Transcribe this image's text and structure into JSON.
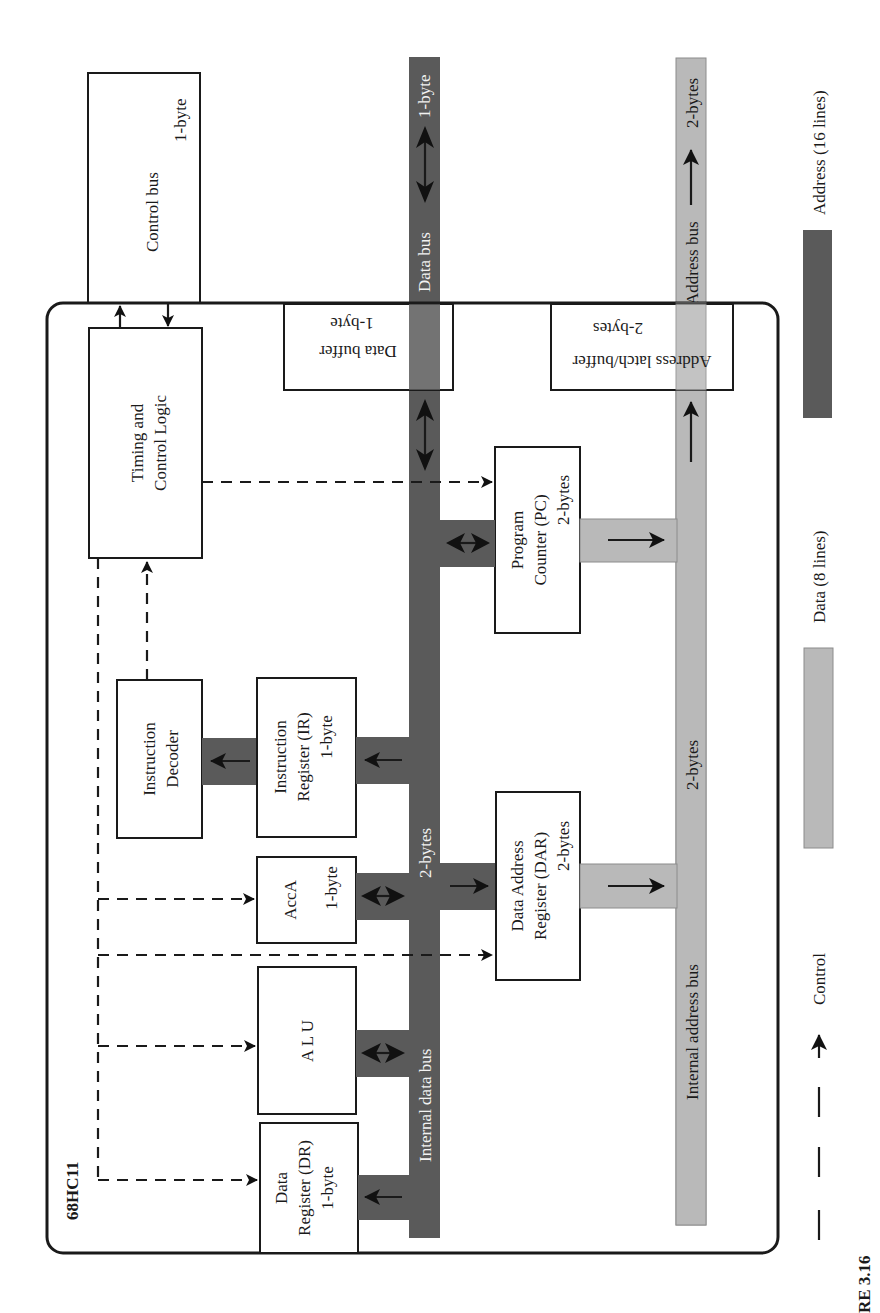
{
  "figure": {
    "chip_label": "68HC11",
    "caption_fragment": "RE 3.16"
  },
  "external": {
    "control_bus": {
      "title": "Control bus",
      "width": "1-byte"
    },
    "data_bus": {
      "title": "Data bus",
      "width": "1-byte"
    },
    "address_bus": {
      "title": "Address bus",
      "width": "2-bytes"
    }
  },
  "blocks": {
    "timing": {
      "line1": "Timing and",
      "line2": "Control Logic"
    },
    "data_buffer": {
      "line1": "Data buffer",
      "line2": "1-byte"
    },
    "address_latch": {
      "line1": "Address latch/buffer",
      "line2": "2-bytes"
    },
    "program_counter": {
      "line1": "Program",
      "line2": "Counter (PC)",
      "line3": "2-bytes"
    },
    "instruction_decoder": {
      "line1": "Instruction",
      "line2": "Decoder"
    },
    "instruction_register": {
      "line1": "Instruction",
      "line2": "Register (IR)",
      "line3": "1-byte"
    },
    "acca": {
      "line1": "AccA",
      "line2": "1-byte"
    },
    "alu": {
      "line1": "A  L  U"
    },
    "data_register": {
      "line1": "Data",
      "line2": "Register (DR)",
      "line3": "1-byte"
    },
    "dar": {
      "line1": "Data Address",
      "line2": "Register (DAR)",
      "line3": "2-bytes"
    }
  },
  "internal": {
    "data_bus": {
      "title": "Internal data bus",
      "width": "2-bytes"
    },
    "address_bus": {
      "title": "Internal address bus",
      "width": "2-bytes"
    }
  },
  "legend": {
    "control": "Control",
    "data": "Data (8 lines)",
    "address": "Address (16 lines)"
  },
  "colors": {
    "dark_bus": "#5a5a5a",
    "light_bus": "#b9b9b9",
    "outline": "#1a1a1a"
  }
}
